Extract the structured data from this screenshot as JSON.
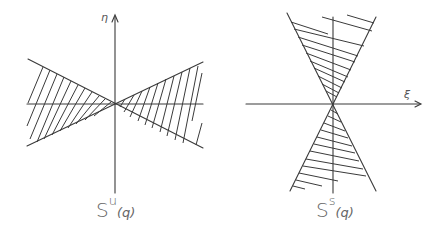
{
  "figures": [
    {
      "id": "unstable-cone",
      "axis_vertical_label": "η",
      "caption_base": "S",
      "caption_superscript": "u",
      "caption_argument": "(q)",
      "description": "Horizontal double cone (hatched) centered at origin, opening left and right"
    },
    {
      "id": "stable-cone",
      "axis_horizontal_label": "ξ",
      "caption_base": "S",
      "caption_superscript": "s",
      "caption_argument": "(q)",
      "description": "Vertical double cone (hatched) centered at origin, opening up and down"
    }
  ],
  "colors": {
    "line": "#3a3a3a",
    "background": "#ffffff"
  }
}
